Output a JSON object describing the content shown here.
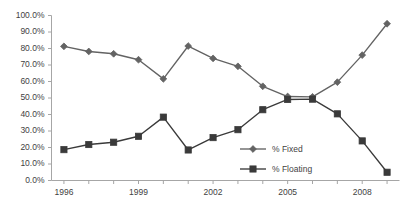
{
  "chart_data": {
    "type": "line",
    "title": "",
    "subtitle": "",
    "xlabel": "",
    "ylabel": "",
    "x": [
      1996,
      1997,
      1998,
      1999,
      2000,
      2001,
      2002,
      2003,
      2004,
      2005,
      2006,
      2007,
      2008,
      2009
    ],
    "xlim": [
      1995.5,
      2009.5
    ],
    "ylim": [
      0,
      100
    ],
    "ytick_values": [
      0,
      10,
      20,
      30,
      40,
      50,
      60,
      70,
      80,
      90,
      100
    ],
    "ytick_labels": [
      "0.0%",
      "10.0%",
      "20.0%",
      "30.0%",
      "40.0%",
      "50.0%",
      "60.0%",
      "70.0%",
      "80.0%",
      "90.0%",
      "100.0%"
    ],
    "xtick_labels": [
      "1996",
      "1999",
      "2002",
      "2005",
      "2008"
    ],
    "xtick_values": [
      1996,
      1999,
      2002,
      2005,
      2008
    ],
    "grid": false,
    "legend_position": "inside-lower-right",
    "series": [
      {
        "name": "% Fixed",
        "marker": "diamond",
        "color": "#636363",
        "values": [
          81.3,
          78.2,
          76.8,
          73.2,
          61.6,
          81.5,
          74.0,
          69.2,
          57.1,
          50.9,
          50.7,
          59.6,
          76.0,
          95.0
        ]
      },
      {
        "name": "% Floating",
        "marker": "square",
        "color": "#3a3a3a",
        "values": [
          18.7,
          21.8,
          23.2,
          26.8,
          38.4,
          18.5,
          26.0,
          30.8,
          42.9,
          49.1,
          49.3,
          40.4,
          24.0,
          5.0
        ]
      }
    ]
  },
  "legend": {
    "items": [
      {
        "label": "% Fixed",
        "marker": "diamond"
      },
      {
        "label": "% Floating",
        "marker": "square"
      }
    ]
  },
  "colors": {
    "fixed": "#636363",
    "floating": "#3a3a3a",
    "axis": "#a6a6a6",
    "text": "#3f3f3f",
    "background": "#ffffff"
  }
}
